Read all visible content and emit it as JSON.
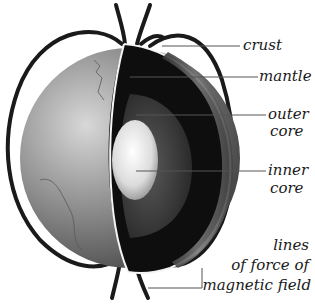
{
  "diagram": {
    "labels": {
      "crust": "crust",
      "mantle": "mantle",
      "outer_core_1": "outer",
      "outer_core_2": "core",
      "inner_core_1": "inner",
      "inner_core_2": "core",
      "field_1": "lines",
      "field_2": "of force of",
      "field_3": "magnetic field"
    },
    "colors": {
      "field_lines": "#1a1a1a",
      "crust_surface": "#8a8a8a",
      "mantle": "#111111",
      "outer_core": "#3a3a3a",
      "inner_core": "#e8e8e8",
      "leader_lines": "#555555"
    }
  }
}
